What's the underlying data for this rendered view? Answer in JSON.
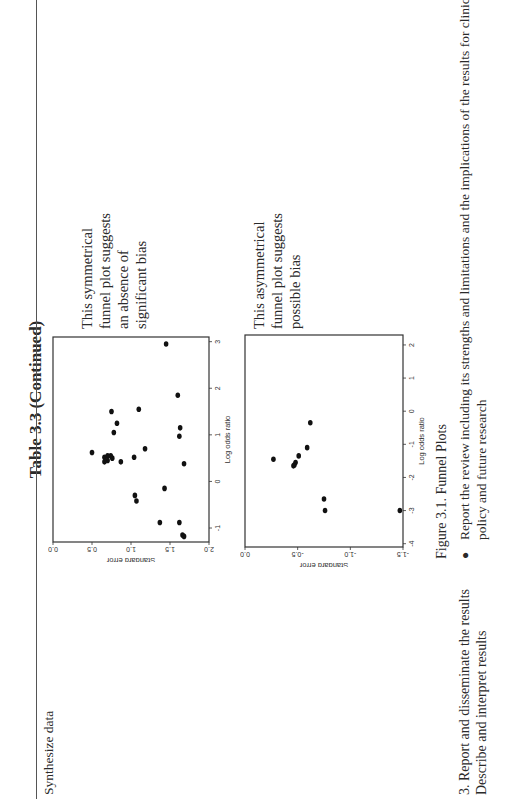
{
  "page": {
    "title": "Table 3.3 (Continued)",
    "row1": {
      "label": "Synthesize data"
    },
    "annotations": {
      "symmetric": [
        "This symmetrical",
        "funnel plot suggests",
        "an absence of",
        "significant bias"
      ],
      "asymmetric": [
        "This asymmetrical",
        "funnel plot suggests",
        "possible bias"
      ]
    },
    "figure_caption": "Figure 3.1. Funnel Plots",
    "row2": {
      "step": "3.  Report and disseminate the results",
      "substep": "Describe and interpret results",
      "bullet_line1": "Report the review including its strengths and limitations and the implications of the results for clinical practice,",
      "bullet_line2": "policy and future research"
    }
  },
  "chart_data": [
    {
      "type": "scatter",
      "title": "Symmetrical funnel plot",
      "xlabel": "Log odds ratio",
      "ylabel": "Standard error",
      "x_ticks": [
        "-1",
        "0",
        "1",
        "2",
        "3"
      ],
      "y_ticks": [
        "0.0",
        "0.5",
        "1.0",
        "1.5",
        "2.0"
      ],
      "xlim": [
        -1.3,
        3.1
      ],
      "ylim": [
        2.0,
        0.0
      ],
      "y_inverted": true,
      "grid": false,
      "points": [
        {
          "x": 2.95,
          "y": 1.45
        },
        {
          "x": 1.85,
          "y": 1.6
        },
        {
          "x": 1.55,
          "y": 1.1
        },
        {
          "x": 1.5,
          "y": 0.75
        },
        {
          "x": 1.25,
          "y": 0.82
        },
        {
          "x": 1.15,
          "y": 1.63
        },
        {
          "x": 1.05,
          "y": 0.78
        },
        {
          "x": 0.97,
          "y": 1.62
        },
        {
          "x": 0.7,
          "y": 1.18
        },
        {
          "x": 0.62,
          "y": 0.5
        },
        {
          "x": 0.55,
          "y": 0.74
        },
        {
          "x": 0.55,
          "y": 0.7
        },
        {
          "x": 0.52,
          "y": 0.66
        },
        {
          "x": 0.5,
          "y": 0.76
        },
        {
          "x": 0.45,
          "y": 0.7
        },
        {
          "x": 0.42,
          "y": 0.66
        },
        {
          "x": 0.42,
          "y": 0.87
        },
        {
          "x": 0.52,
          "y": 1.04
        },
        {
          "x": 0.38,
          "y": 1.68
        },
        {
          "x": -0.15,
          "y": 1.43
        },
        {
          "x": -0.3,
          "y": 1.05
        },
        {
          "x": -0.42,
          "y": 1.07
        },
        {
          "x": -0.88,
          "y": 1.37
        },
        {
          "x": -0.88,
          "y": 1.62
        },
        {
          "x": -1.15,
          "y": 1.66
        },
        {
          "x": -1.18,
          "y": 1.68
        }
      ]
    },
    {
      "type": "scatter",
      "title": "Asymmetrical funnel plot",
      "xlabel": "Log odds ratio",
      "ylabel": "Standard error",
      "x_ticks": [
        "-4",
        "-3",
        "-2",
        "-1",
        "0",
        "1",
        "2"
      ],
      "y_ticks": [
        "0.0",
        "-0.5",
        "-1.0",
        "-1.5"
      ],
      "xlim": [
        -4.1,
        2.3
      ],
      "ylim": [
        -1.5,
        0.0
      ],
      "grid": false,
      "points": [
        {
          "x": -0.35,
          "y": -0.62
        },
        {
          "x": -1.1,
          "y": -0.59
        },
        {
          "x": -1.35,
          "y": -0.51
        },
        {
          "x": -1.45,
          "y": -0.27
        },
        {
          "x": -1.55,
          "y": -0.48
        },
        {
          "x": -1.62,
          "y": -0.47
        },
        {
          "x": -1.65,
          "y": -0.46
        },
        {
          "x": -2.65,
          "y": -0.75
        },
        {
          "x": -3.0,
          "y": -0.76
        },
        {
          "x": -3.0,
          "y": -1.47
        }
      ]
    }
  ]
}
